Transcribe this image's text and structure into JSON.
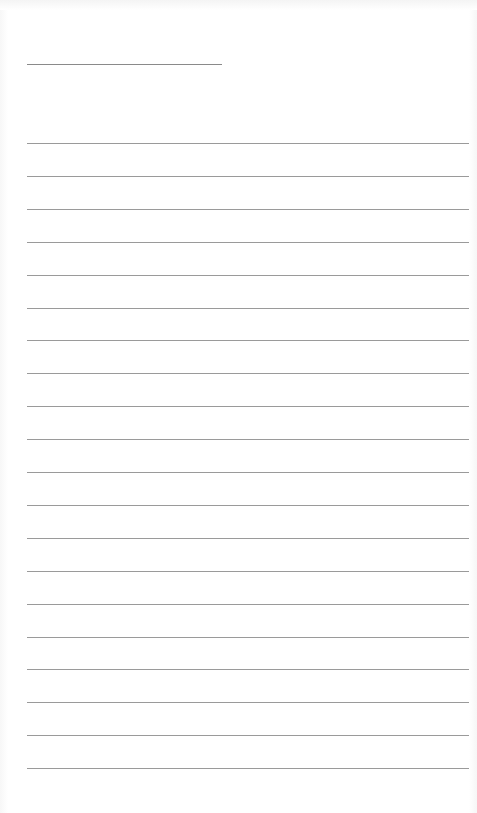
{
  "document": {
    "type": "lined-page",
    "title_line": {
      "filled_text": ""
    },
    "ruled_lines": [
      {
        "text": ""
      },
      {
        "text": ""
      },
      {
        "text": ""
      },
      {
        "text": ""
      },
      {
        "text": ""
      },
      {
        "text": ""
      },
      {
        "text": ""
      },
      {
        "text": ""
      },
      {
        "text": ""
      },
      {
        "text": ""
      },
      {
        "text": ""
      },
      {
        "text": ""
      },
      {
        "text": ""
      },
      {
        "text": ""
      },
      {
        "text": ""
      },
      {
        "text": ""
      },
      {
        "text": ""
      },
      {
        "text": ""
      },
      {
        "text": ""
      },
      {
        "text": ""
      }
    ]
  }
}
